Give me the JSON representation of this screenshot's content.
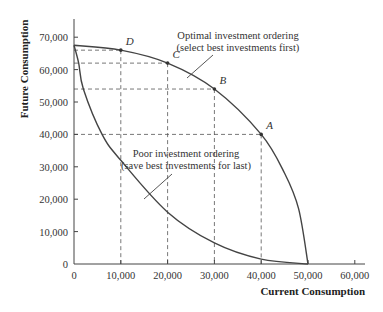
{
  "chart_data": {
    "type": "line",
    "title": "",
    "xlabel": "Current Consumption",
    "ylabel": "Future Consumption",
    "xlim": [
      0,
      60000
    ],
    "ylim": [
      0,
      75000
    ],
    "x_ticks": [
      0,
      10000,
      20000,
      30000,
      40000,
      50000,
      60000
    ],
    "x_tick_labels": [
      "0",
      "10,000",
      "20,000",
      "30,000",
      "40,000",
      "50,000",
      "60,000"
    ],
    "y_ticks": [
      0,
      10000,
      20000,
      30000,
      40000,
      50000,
      60000,
      70000
    ],
    "y_tick_labels": [
      "0",
      "10,000",
      "20,000",
      "30,000",
      "40,000",
      "50,000",
      "60,000",
      "70,000"
    ],
    "grid": false,
    "legend": "none (inline annotations)",
    "series": [
      {
        "name": "Optimal investment ordering (select best investments first)",
        "x": [
          0,
          10000,
          20000,
          30000,
          40000,
          45000,
          48000,
          50000
        ],
        "y": [
          67500,
          66000,
          62000,
          54000,
          40000,
          28000,
          17000,
          0
        ]
      },
      {
        "name": "Poor investment ordering (save best investments for last)",
        "x": [
          0,
          1000,
          2000,
          6000,
          10000,
          20000,
          30000,
          40000,
          50000
        ],
        "y": [
          67500,
          62000,
          54000,
          40000,
          32000,
          16000,
          6500,
          1500,
          0
        ]
      }
    ],
    "labeled_points": [
      {
        "label": "A",
        "x": 40000,
        "y": 40000
      },
      {
        "label": "B",
        "x": 30000,
        "y": 54000
      },
      {
        "label": "C",
        "x": 20000,
        "y": 62000
      },
      {
        "label": "D",
        "x": 10000,
        "y": 66000
      }
    ],
    "annotations": [
      {
        "lines": [
          "Optimal investment ordering",
          "(select best investments first)"
        ],
        "target": "optimal curve"
      },
      {
        "lines": [
          "Poor investment ordering",
          "(save best investments for last)"
        ],
        "target": "poor curve"
      }
    ]
  },
  "layout": {
    "origin_px": [
      74,
      264
    ],
    "px_per_unit_x": 0.00468,
    "px_per_unit_y": 0.00324,
    "x_axis_end_px": 365,
    "y_axis_top_px": 19
  },
  "colors": {
    "line": "#444444",
    "text": "#333333",
    "background": "#ffffff"
  }
}
